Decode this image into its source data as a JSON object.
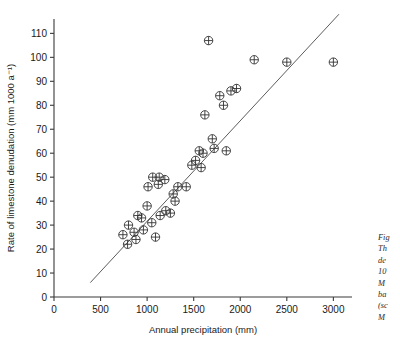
{
  "chart_data": {
    "type": "scatter",
    "title": "",
    "xlabel": "Annual precipitation (mm)",
    "ylabel": "Rate of limestone denudation (mm 1000 a⁻¹)",
    "xlim": [
      0,
      3200
    ],
    "ylim": [
      0,
      116
    ],
    "xticks": [
      0,
      500,
      1000,
      1500,
      2000,
      2500,
      3000
    ],
    "xticklabels": [
      "0",
      "500",
      "1000",
      "1500",
      "2000",
      "2500",
      "3000"
    ],
    "yticks": [
      0,
      10,
      20,
      30,
      40,
      50,
      60,
      70,
      80,
      90,
      100,
      110
    ],
    "yticklabels": [
      "0",
      "10",
      "20",
      "30",
      "40",
      "50",
      "60",
      "70",
      "80",
      "90",
      "100",
      "110"
    ],
    "grid": false,
    "legend": null,
    "marker": "circle-with-cross",
    "points": [
      {
        "x": 740,
        "y": 26
      },
      {
        "x": 790,
        "y": 22
      },
      {
        "x": 800,
        "y": 30
      },
      {
        "x": 860,
        "y": 27
      },
      {
        "x": 880,
        "y": 24
      },
      {
        "x": 900,
        "y": 34
      },
      {
        "x": 940,
        "y": 33
      },
      {
        "x": 960,
        "y": 28
      },
      {
        "x": 1000,
        "y": 38
      },
      {
        "x": 1010,
        "y": 46
      },
      {
        "x": 1050,
        "y": 31
      },
      {
        "x": 1060,
        "y": 50
      },
      {
        "x": 1090,
        "y": 25
      },
      {
        "x": 1120,
        "y": 47
      },
      {
        "x": 1130,
        "y": 50
      },
      {
        "x": 1140,
        "y": 34
      },
      {
        "x": 1190,
        "y": 49
      },
      {
        "x": 1200,
        "y": 36
      },
      {
        "x": 1250,
        "y": 35
      },
      {
        "x": 1280,
        "y": 43
      },
      {
        "x": 1300,
        "y": 40
      },
      {
        "x": 1330,
        "y": 46
      },
      {
        "x": 1420,
        "y": 46
      },
      {
        "x": 1480,
        "y": 55
      },
      {
        "x": 1520,
        "y": 57
      },
      {
        "x": 1560,
        "y": 61
      },
      {
        "x": 1580,
        "y": 54
      },
      {
        "x": 1600,
        "y": 60
      },
      {
        "x": 1620,
        "y": 76
      },
      {
        "x": 1660,
        "y": 107
      },
      {
        "x": 1700,
        "y": 66
      },
      {
        "x": 1720,
        "y": 62
      },
      {
        "x": 1780,
        "y": 84
      },
      {
        "x": 1820,
        "y": 80
      },
      {
        "x": 1850,
        "y": 61
      },
      {
        "x": 1900,
        "y": 86
      },
      {
        "x": 1960,
        "y": 87
      },
      {
        "x": 2150,
        "y": 99
      },
      {
        "x": 2500,
        "y": 98
      },
      {
        "x": 3000,
        "y": 98
      }
    ],
    "fit_line": {
      "x0": 390,
      "y0": 6,
      "x1": 3060,
      "y1": 118
    }
  },
  "caption": {
    "lines": [
      "Fig",
      "Th",
      "de",
      "10",
      "M",
      "ba",
      "(sc",
      "M"
    ]
  }
}
